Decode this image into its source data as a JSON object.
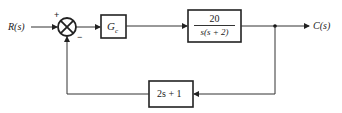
{
  "diagram": {
    "type": "closed-loop feedback block diagram",
    "input_label": "R(s)",
    "output_label": "C(s)",
    "summing_junction": {
      "plus_sign": "+",
      "minus_sign": "−"
    },
    "controller_block": {
      "label_main": "G",
      "label_sub": "c"
    },
    "plant_block": {
      "numerator": "20",
      "denominator": "s(s + 2)"
    },
    "feedback_block": {
      "label": "2s + 1"
    },
    "colors": {
      "line": "#333333",
      "background": "#ffffff"
    }
  }
}
